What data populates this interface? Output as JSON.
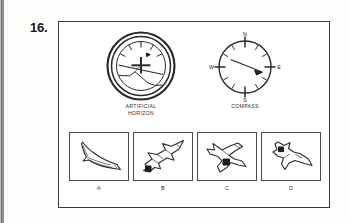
{
  "question": {
    "number": "16."
  },
  "instruments": [
    {
      "id": "artificial-horizon",
      "caption": "ARTIFICIAL\nHORIZON",
      "type": "attitude-indicator",
      "reading": "nose-level-bank-right-descending-horizon"
    },
    {
      "id": "compass",
      "caption": "COMPASS",
      "type": "magnetic-compass",
      "cardinals": {
        "north": "N",
        "east": "E",
        "south": "S",
        "west": "W"
      },
      "needle_heading": "ESE"
    }
  ],
  "options": [
    {
      "label": "A",
      "name": "aircraft-level-flight"
    },
    {
      "label": "B",
      "name": "aircraft-climbing"
    },
    {
      "label": "C",
      "name": "aircraft-banking-view-from-below"
    },
    {
      "label": "D",
      "name": "aircraft-diving"
    }
  ],
  "colors": {
    "ink": "#2a2a2a",
    "frame": "#3b3b3b",
    "paper": "#ffffff"
  }
}
